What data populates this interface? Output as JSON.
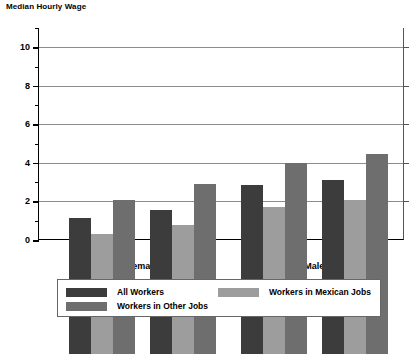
{
  "chart_data": {
    "type": "bar",
    "title": "Median Hourly Wage",
    "xlabel": "",
    "ylabel": "Median Hourly Wage",
    "ylim": [
      0,
      11
    ],
    "yticks": [
      0,
      2,
      4,
      6,
      8,
      10
    ],
    "ytick_labels": [
      "0",
      "2",
      "4",
      "6",
      "8",
      "10"
    ],
    "minor_yticks": [
      1,
      3,
      5,
      7,
      9,
      11
    ],
    "grid": true,
    "legend_position": "bottom",
    "categories": [
      "Border",
      "Interior",
      "Border",
      "Interior"
    ],
    "supercategories": [
      "Female",
      "Male"
    ],
    "series": [
      {
        "name": "All Workers",
        "color": "#3c3c3c",
        "values": [
          7.05,
          7.45,
          8.75,
          9.05
        ]
      },
      {
        "name": "Workers in Mexican Jobs",
        "color": "#9d9d9d",
        "values": [
          6.25,
          6.7,
          7.65,
          8.0
        ]
      },
      {
        "name": "Workers in Other Jobs",
        "color": "#6e6e6e",
        "values": [
          8.0,
          8.8,
          9.9,
          10.4
        ]
      }
    ]
  },
  "axis": {
    "y_labels": [
      "10",
      "8",
      "6",
      "4",
      "2",
      "0"
    ]
  },
  "x_axis": {
    "group_labels": [
      "Border",
      "Interior",
      "Border",
      "Interior"
    ],
    "super_labels": [
      "Female",
      "Male"
    ]
  },
  "legend": {
    "entries": [
      {
        "label": "All Workers",
        "color": "#3c3c3c"
      },
      {
        "label": "Workers in Mexican Jobs",
        "color": "#9d9d9d"
      },
      {
        "label": "Workers in Other Jobs",
        "color": "#6e6e6e"
      }
    ]
  }
}
